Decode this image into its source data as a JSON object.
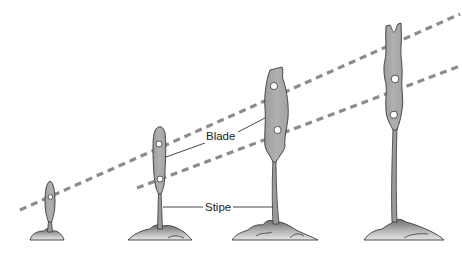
{
  "diagram": {
    "type": "kelp growth stages",
    "labels": {
      "blade": "Blade",
      "stipe": "Stipe"
    },
    "stages": [
      {
        "id": 1,
        "description": "smallest young kelp, one hole in blade"
      },
      {
        "id": 2,
        "description": "young kelp, two holes in blade"
      },
      {
        "id": 3,
        "description": "mid-size kelp, two holes in blade"
      },
      {
        "id": 4,
        "description": "tallest kelp, two holes in blade"
      }
    ],
    "guide_lines": [
      {
        "name": "upper-hole-trend",
        "style": "dashed"
      },
      {
        "name": "lower-hole-trend",
        "style": "dashed"
      }
    ],
    "colors": {
      "blade_fill": "#a9a9a9",
      "outline": "#3a3a3a",
      "dash": "#8c8c8c",
      "rock_light": "#d8d8d8",
      "rock_dark": "#7a7a7a",
      "label_text": "#222222"
    }
  }
}
